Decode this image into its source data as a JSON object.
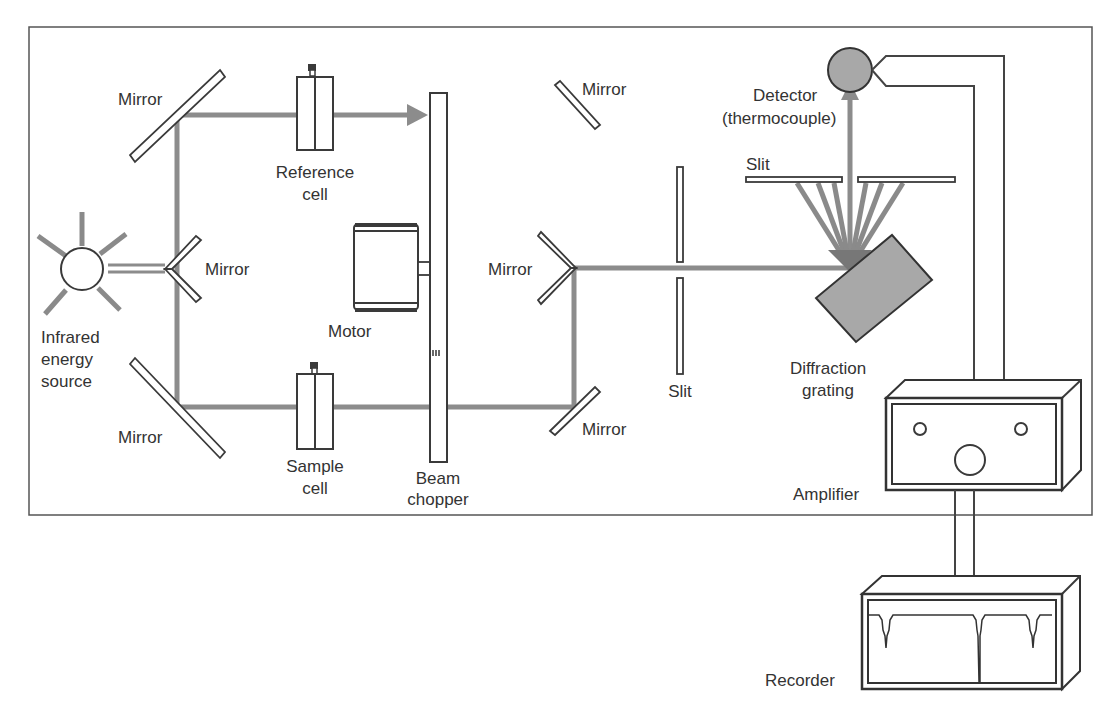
{
  "diagram": {
    "colors": {
      "beam": "#8c8c8c",
      "outline": "#3a3a3a",
      "detector_fill": "#a8a8a8",
      "grating_fill": "#a8a8a8",
      "text": "#333333"
    },
    "labels": {
      "mirror_top_left": "Mirror",
      "mirror_center_left": "Mirror",
      "mirror_bottom_left": "Mirror",
      "source_line1": "Infrared",
      "source_line2": "energy",
      "source_line3": "source",
      "reference_line1": "Reference",
      "reference_line2": "cell",
      "sample_line1": "Sample",
      "sample_line2": "cell",
      "motor": "Motor",
      "chopper_line1": "Beam",
      "chopper_line2": "chopper",
      "mirror_top_right": "Mirror",
      "mirror_v_right": "Mirror",
      "mirror_bottom_right": "Mirror",
      "entrance_slit": "Slit",
      "exit_slit": "Slit",
      "detector_line1": "Detector",
      "detector_line2": "(thermocouple)",
      "grating_line1": "Diffraction",
      "grating_line2": "grating",
      "amplifier": "Amplifier",
      "recorder": "Recorder"
    },
    "components": [
      "Infrared energy source",
      "Mirror",
      "Reference cell",
      "Sample cell",
      "Motor",
      "Beam chopper",
      "Slit",
      "Diffraction grating",
      "Detector (thermocouple)",
      "Amplifier",
      "Recorder"
    ]
  }
}
